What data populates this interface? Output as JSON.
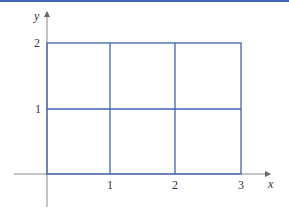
{
  "diagram": {
    "axes": {
      "x_label": "x",
      "y_label": "y"
    },
    "x_ticks": [
      "1",
      "2",
      "3"
    ],
    "y_ticks": [
      "1",
      "2"
    ],
    "grid": {
      "x_range": [
        0,
        3
      ],
      "y_range": [
        0,
        2
      ],
      "cols": 3,
      "rows": 2
    },
    "colors": {
      "grid": "#3f63b0",
      "axis": "#8a8a8a",
      "top_bar": "#3f63b0"
    }
  }
}
